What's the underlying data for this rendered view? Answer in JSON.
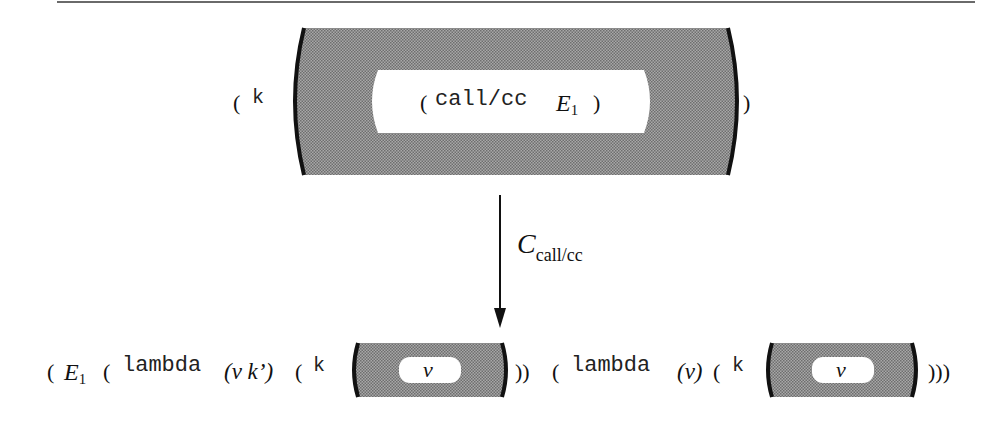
{
  "figure": {
    "top_expression": {
      "prefix_paren": "(",
      "prefix_k": "k",
      "inner_open": "(",
      "inner_call": "call/cc",
      "inner_E": "E",
      "inner_E_sub": "1",
      "inner_close": ")",
      "suffix_paren": ")"
    },
    "arrow": {
      "label_C": "C",
      "label_sub": "call/cc"
    },
    "bottom_expression": {
      "p1": "(",
      "E": "E",
      "E_sub": "1",
      "p2": "(",
      "lambda1": "lambda",
      "params1": "(v k’)",
      "p3": "(",
      "k1": "k",
      "hole1_value": "v",
      "close1": "))",
      "p4": "(",
      "lambda2": "lambda",
      "params2": "(v)",
      "p5": "(",
      "k2": "k",
      "hole2_value": "v",
      "close2": ")))"
    },
    "colors": {
      "context_fill": "#8c8c8c",
      "bracket": "#111111",
      "hole": "#ffffff"
    }
  }
}
